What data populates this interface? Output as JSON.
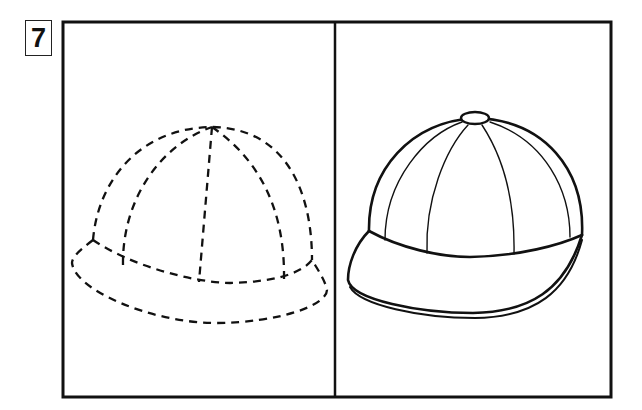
{
  "exercise": {
    "number": "7",
    "panels": [
      {
        "id": "left",
        "content": "dashed-outline cap (tracing guide)"
      },
      {
        "id": "right",
        "content": "solid-outline baseball cap (reference)"
      }
    ]
  },
  "colors": {
    "stroke": "#111111",
    "background": "#ffffff"
  }
}
